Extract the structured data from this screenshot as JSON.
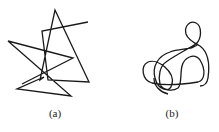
{
  "figure": {
    "panels": [
      {
        "label": "(a)",
        "shape": "self-intersecting polyline",
        "stroke_color": "#1a1a1a",
        "points": [
          [
            88,
            22
          ],
          [
            42,
            31
          ],
          [
            48,
            80
          ],
          [
            89,
            82
          ],
          [
            55,
            10
          ],
          [
            40,
            80
          ],
          [
            44,
            77
          ],
          [
            17,
            89
          ],
          [
            71,
            96
          ],
          [
            8,
            41
          ],
          [
            73,
            58
          ],
          [
            22,
            84
          ]
        ]
      },
      {
        "label": "(b)",
        "shape": "smooth looping curve",
        "stroke_color": "#1a1a1a"
      }
    ]
  }
}
